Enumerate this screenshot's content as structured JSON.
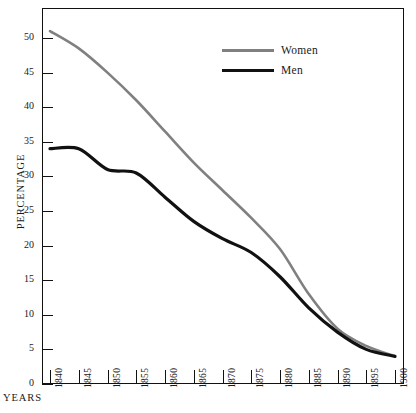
{
  "page": {
    "title_remnant": "",
    "background": "#ffffff"
  },
  "axes": {
    "y_title": "PERCENTAGE",
    "x_title": "YEARS",
    "y_ticks": [
      "0",
      "5",
      "10",
      "15",
      "20",
      "25",
      "30",
      "35",
      "40",
      "45",
      "50"
    ],
    "x_ticks": [
      "1840",
      "1845",
      "1850",
      "1855",
      "1860",
      "1865",
      "1870",
      "1875",
      "1880",
      "1885",
      "1890",
      "1895",
      "1900"
    ]
  },
  "legend": {
    "position": "top-right-inside",
    "entries": [
      {
        "label": "Women",
        "color": "#808080"
      },
      {
        "label": "Men",
        "color": "#111111"
      }
    ]
  },
  "colors": {
    "women_line": "#808080",
    "men_line": "#111111",
    "frame": "#111111",
    "text": "#1a1a1a"
  },
  "chart_data": {
    "type": "line",
    "title": "",
    "xlabel": "YEARS",
    "ylabel": "PERCENTAGE",
    "xlim": [
      1840,
      1900
    ],
    "ylim": [
      0,
      50
    ],
    "grid": false,
    "legend_position": "upper right",
    "x": [
      1840,
      1845,
      1850,
      1855,
      1860,
      1865,
      1870,
      1875,
      1880,
      1885,
      1890,
      1895,
      1900
    ],
    "series": [
      {
        "name": "Women",
        "color": "#808080",
        "values": [
          51.0,
          48.5,
          45.0,
          41.0,
          36.5,
          32.0,
          28.0,
          24.0,
          19.5,
          13.0,
          8.0,
          5.5,
          4.0
        ]
      },
      {
        "name": "Men",
        "color": "#111111",
        "values": [
          34.0,
          34.0,
          31.0,
          30.5,
          27.0,
          23.5,
          21.0,
          19.0,
          15.5,
          11.0,
          7.5,
          5.0,
          4.0
        ]
      }
    ]
  }
}
